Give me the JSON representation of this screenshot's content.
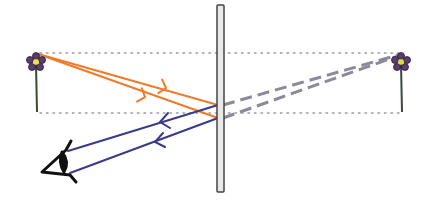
{
  "diagram": {
    "title": "",
    "colors": {
      "incident_ray": "#f07a2a",
      "reflected_ray": "#3a3a8c",
      "virtual_ray": "#8a8a9a",
      "guide_line": "#9a9aa8",
      "mirror_fill": "#e8e8e8",
      "mirror_stroke": "#444444",
      "flower_petal": "#5a3d6b",
      "flower_center": "#f2e23a",
      "stem": "#2f4f2f",
      "eye": "#111111"
    },
    "elements": [
      {
        "name": "object-flower",
        "role": "object",
        "x": 36,
        "y": 62
      },
      {
        "name": "image-flower",
        "role": "virtual image",
        "x": 400,
        "y": 62
      },
      {
        "name": "plane-mirror",
        "role": "mirror",
        "x": 221
      },
      {
        "name": "eye",
        "role": "observer",
        "x": 55,
        "y": 160
      }
    ]
  }
}
